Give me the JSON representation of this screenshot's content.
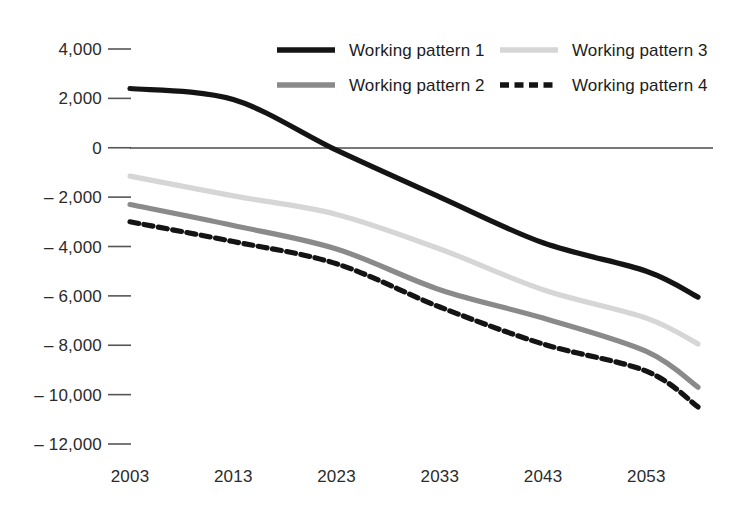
{
  "chart_data": {
    "type": "line",
    "title": "",
    "subtitle": "",
    "xlabel": "",
    "ylabel": "",
    "x": [
      2003,
      2013,
      2023,
      2033,
      2043,
      2053,
      2058
    ],
    "xlim": [
      2003,
      2058
    ],
    "ylim": [
      -12000,
      4000
    ],
    "grid": false,
    "legend_position": "top",
    "xticks": [
      "2003",
      "2013",
      "2023",
      "2033",
      "2043",
      "2053"
    ],
    "xtick_values": [
      2003,
      2013,
      2023,
      2033,
      2043,
      2053
    ],
    "yticks": [
      "4,000",
      "2,000",
      "0",
      "– 2,000",
      "– 4,000",
      "– 6,000",
      "– 8,000",
      "– 10,000",
      "– 12,000"
    ],
    "ytick_values": [
      4000,
      2000,
      0,
      -2000,
      -4000,
      -6000,
      -8000,
      -10000,
      -12000
    ],
    "series": [
      {
        "name": "Working pattern 1",
        "color": "#141414",
        "style": "solid",
        "width": 5.2,
        "values": [
          2400,
          1950,
          -100,
          -2000,
          -3850,
          -5000,
          -6050
        ]
      },
      {
        "name": "Working pattern 2",
        "color": "#8a8a8a",
        "style": "solid",
        "width": 5.2,
        "values": [
          -2300,
          -3150,
          -4100,
          -5750,
          -6900,
          -8250,
          -9700
        ]
      },
      {
        "name": "Working pattern 3",
        "color": "#d6d6d6",
        "style": "solid",
        "width": 5.2,
        "values": [
          -1150,
          -1950,
          -2700,
          -4100,
          -5750,
          -6900,
          -7950
        ]
      },
      {
        "name": "Working pattern 4",
        "color": "#141414",
        "style": "dashed",
        "width": 5.2,
        "values": [
          -3000,
          -3800,
          -4700,
          -6450,
          -7950,
          -9050,
          -10500
        ]
      }
    ]
  },
  "legend": {
    "entries": [
      {
        "label": "Working pattern 1"
      },
      {
        "label": "Working pattern 2"
      },
      {
        "label": "Working pattern 3"
      },
      {
        "label": "Working pattern 4"
      }
    ]
  },
  "axis": {
    "zero_line_value": "0"
  }
}
